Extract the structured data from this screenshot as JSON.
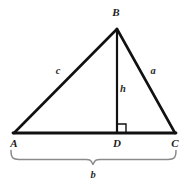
{
  "figure": {
    "kind": "geometry-diagram",
    "background_color": "#ffffff",
    "stroke_color": "#111111",
    "brace_color": "#8a8a8a",
    "label_color": "#1c1c1c",
    "width": 187,
    "height": 192
  },
  "vertices": [
    {
      "id": "A",
      "label": "A",
      "x": 14,
      "y": 133,
      "label_x": 14,
      "label_y": 143
    },
    {
      "id": "B",
      "label": "B",
      "x": 117,
      "y": 29,
      "label_x": 116,
      "label_y": 13
    },
    {
      "id": "C",
      "label": "C",
      "x": 175,
      "y": 133,
      "label_x": 175,
      "label_y": 143
    },
    {
      "id": "D",
      "label": "D",
      "x": 117,
      "y": 133,
      "label_x": 117,
      "label_y": 143
    }
  ],
  "sides": [
    {
      "id": "c",
      "label": "c",
      "from": "A",
      "to": "B",
      "label_x": 58,
      "label_y": 72
    },
    {
      "id": "a",
      "label": "a",
      "from": "B",
      "to": "C",
      "label_x": 153,
      "label_y": 72
    },
    {
      "id": "b",
      "label": "b",
      "from": "A",
      "to": "C",
      "label_x": 93,
      "label_y": 175
    },
    {
      "id": "h",
      "label": "h",
      "from": "B",
      "to": "D",
      "label_x": 123,
      "label_y": 90
    }
  ],
  "marks": {
    "right_angle": {
      "name": "right-angle-mark",
      "at_vertex": "D",
      "size": 8,
      "orientation": "upper-right"
    },
    "brace": {
      "name": "base-measure-brace",
      "spans": "A-to-C",
      "label": "b",
      "left_x": 11,
      "right_x": 176,
      "top_y": 151,
      "center_x": 93,
      "tip_y": 165
    }
  }
}
